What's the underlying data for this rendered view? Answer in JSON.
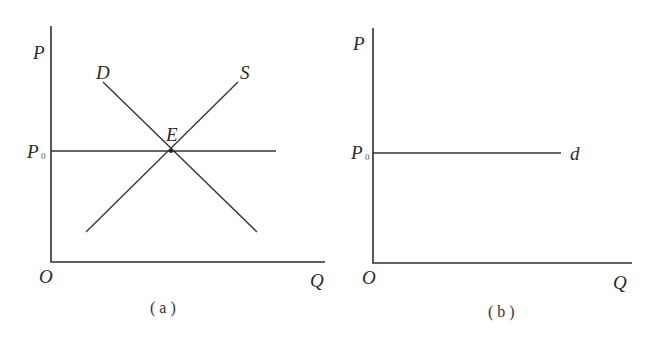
{
  "panels": [
    {
      "id": "a",
      "caption": "( a )",
      "y_axis_label": "P",
      "x_axis_label": "Q",
      "origin_label": "O",
      "price_label": "P",
      "price_label_sub": "0",
      "curves": [
        {
          "name": "demand",
          "label": "D"
        },
        {
          "name": "supply",
          "label": "S"
        },
        {
          "name": "price-line",
          "label": ""
        }
      ],
      "equilibrium_label": "E"
    },
    {
      "id": "b",
      "caption": "( b )",
      "y_axis_label": "P",
      "x_axis_label": "Q",
      "origin_label": "O",
      "price_label": "P",
      "price_label_sub": "0",
      "curves": [
        {
          "name": "firm-demand",
          "label": "d"
        }
      ]
    }
  ],
  "colors": {
    "line": "#333333",
    "background": "#ffffff"
  }
}
